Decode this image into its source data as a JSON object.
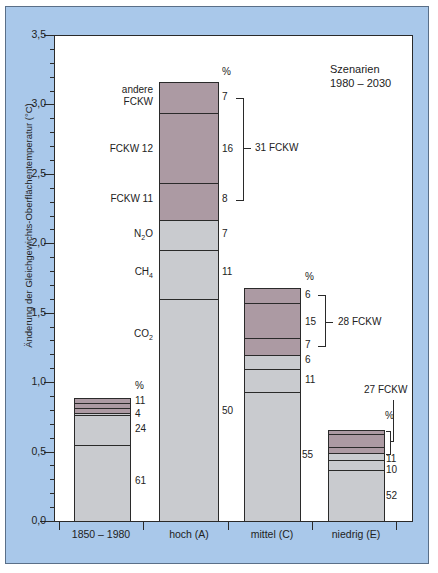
{
  "chart_data": {
    "type": "bar",
    "stacked": true,
    "title": "Szenarien 1980 – 2030",
    "xlabel": "",
    "ylabel": "Änderung der Gleichgewichts-Oberflächentemperatur (°C)",
    "ylim": [
      0,
      3.5
    ],
    "yticks": [
      "0,0",
      "0,5",
      "1,0",
      "1,5",
      "2,0",
      "2,5",
      "3,0",
      "3,5"
    ],
    "grid": false,
    "categories": [
      "1850–1980",
      "hoch (A)",
      "mittel (C)",
      "niedrig (E)"
    ],
    "totals": [
      0.88,
      3.15,
      1.67,
      0.65
    ],
    "series": [
      {
        "name": "CO2",
        "percent": [
          61,
          50,
          55,
          52
        ],
        "values": [
          0.54,
          1.6,
          0.93,
          0.34
        ]
      },
      {
        "name": "CH4",
        "percent": [
          24,
          11,
          11,
          10
        ],
        "values": [
          0.21,
          0.35,
          0.17,
          0.07
        ]
      },
      {
        "name": "N2O",
        "percent": [
          4,
          7,
          6,
          11
        ],
        "values": [
          0.02,
          0.22,
          0.1,
          0.05
        ]
      },
      {
        "name": "FCKW 11",
        "percent": [
          null,
          8,
          7,
          null
        ],
        "values": [
          0.04,
          0.27,
          0.12,
          0.04
        ]
      },
      {
        "name": "FCKW 12",
        "percent": [
          null,
          16,
          15,
          null
        ],
        "values": [
          0.04,
          0.5,
          0.25,
          0.09
        ]
      },
      {
        "name": "andere FCKW",
        "percent": [
          11,
          7,
          6,
          null
        ],
        "values": [
          0.03,
          0.22,
          0.1,
          0.03
        ]
      }
    ],
    "annotations": [
      "31 FCKW",
      "28 FCKW",
      "27 FCKW",
      "%"
    ]
  },
  "labels": {
    "title_line1": "Szenarien",
    "title_line2": "1980 – 2030",
    "ylabel": "Änderung der Gleichgewichts-Oberflächentemperatur (°C)",
    "yticks": [
      "0,0",
      "0,5",
      "1,0",
      "1,5",
      "2,0",
      "2,5",
      "3,0",
      "3,5"
    ],
    "xcats": [
      "1850 – 1980",
      "hoch (A)",
      "mittel (C)",
      "niedrig (E)"
    ],
    "percent_sign": "%",
    "gas_andere_1": "andere",
    "gas_andere_2": "FCKW",
    "gas_fckw12": "FCKW 12",
    "gas_fckw11": "FCKW 11",
    "gas_n2o": "N",
    "gas_n2o_sub": "2",
    "gas_n2o_end": "O",
    "gas_ch4": "CH",
    "gas_ch4_sub": "4",
    "gas_co2": "CO",
    "gas_co2_sub": "2",
    "bar1_pct": [
      "11",
      "4",
      "24",
      "61"
    ],
    "bar2_pct": [
      "7",
      "16",
      "8",
      "7",
      "11",
      "50"
    ],
    "bar3_pct": [
      "6",
      "15",
      "7",
      "6",
      "11",
      "55"
    ],
    "bar4_pct": [
      "11",
      "10",
      "52"
    ],
    "fckw_bar2": "31 FCKW",
    "fckw_bar3": "28 FCKW",
    "fckw_bar4": "27 FCKW"
  },
  "colors": {
    "frame": "#a9c8ea",
    "fckw": "#ac9aa3",
    "other_gases": "#c9cbcf",
    "plot_bg": "#ffffff"
  }
}
